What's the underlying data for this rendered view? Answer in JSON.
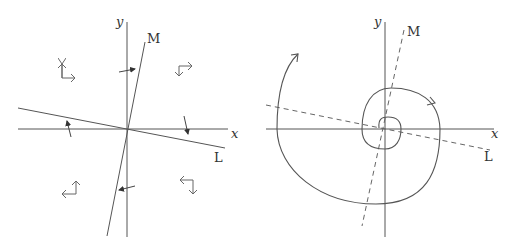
{
  "left_diagram": {
    "labels": {
      "y_axis": "y",
      "x_axis": "x",
      "line_m": "M",
      "line_l": "L"
    },
    "geometry": {
      "origin": [
        127,
        129
      ],
      "x_axis": [
        [
          18,
          129
        ],
        [
          228,
          129
        ]
      ],
      "y_axis": [
        [
          127,
          22
        ],
        [
          127,
          237
        ]
      ],
      "line_m": [
        [
          145,
          42
        ],
        [
          107,
          236
        ]
      ],
      "line_l": [
        [
          18,
          108
        ],
        [
          225,
          148
        ]
      ],
      "cross_arrows": [
        {
          "from": [
            119,
            72
          ],
          "to": [
            135,
            69
          ]
        },
        {
          "from": [
            71,
            137
          ],
          "to": [
            67,
            121
          ]
        },
        {
          "from": [
            184,
            116
          ],
          "to": [
            188,
            134
          ]
        },
        {
          "from": [
            135,
            186
          ],
          "to": [
            119,
            190
          ]
        }
      ],
      "quadrant_glyphs": [
        {
          "name": "up-right",
          "corner": [
            62,
            78
          ],
          "tips": [
            [
              62,
              64
            ],
            [
              75,
              78
            ]
          ]
        },
        {
          "name": "right-down",
          "corner": [
            179,
            66
          ],
          "tips": [
            [
              192,
              66
            ],
            [
              179,
              76
            ]
          ]
        },
        {
          "name": "up-left",
          "corner": [
            76,
            194
          ],
          "tips": [
            [
              76,
              181
            ],
            [
              62,
              194
            ]
          ]
        },
        {
          "name": "left-down",
          "corner": [
            193,
            180
          ],
          "tips": [
            [
              180,
              180
            ],
            [
              193,
              194
            ]
          ]
        }
      ]
    }
  },
  "right_diagram": {
    "labels": {
      "y_axis": "y",
      "x_axis": "x",
      "line_m": "M",
      "line_l": "L"
    },
    "geometry": {
      "origin": [
        127,
        129
      ],
      "x_axis": [
        [
          8,
          129
        ],
        [
          236,
          129
        ]
      ],
      "y_axis": [
        [
          127,
          22
        ],
        [
          127,
          237
        ]
      ],
      "line_m_dashed": [
        [
          146,
          30
        ],
        [
          104,
          226
        ]
      ],
      "line_l_dashed": [
        [
          8,
          105
        ],
        [
          232,
          150
        ]
      ],
      "spiral_path": "M 127 129 C 120 112, 112 117, 120 115 C 136 110, 148 118, 147 129 C 146 145, 140 150, 127 150 C 108 150, 104 143, 103 129 C 102 104, 112 89, 131 88 C 159 87, 184 96, 183 129 C 182 172, 170 204, 120 203 C 60 202, 26 170, 26 129 C 26 96, 30 70, 45 52",
      "spiral_arrows": [
        {
          "at": [
            45,
            52
          ],
          "direction": "up-right"
        },
        {
          "at": [
            176,
            102
          ],
          "direction": "down-right"
        }
      ]
    }
  }
}
